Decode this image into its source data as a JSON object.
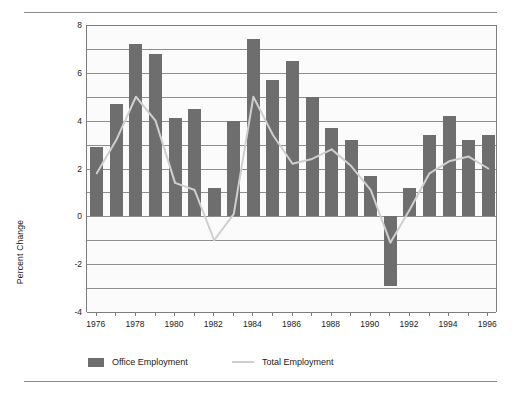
{
  "chart_data": {
    "type": "bar",
    "title": "",
    "xlabel": "",
    "ylabel": "Percent Change",
    "ylim": [
      -4,
      8
    ],
    "ytick_labels": [
      "8",
      "6",
      "4",
      "2",
      "0",
      "-2",
      "-4"
    ],
    "ytick_values": [
      8,
      6,
      4,
      2,
      0,
      -2,
      -4
    ],
    "gridlines_every": 1,
    "grid": true,
    "legend_position": "bottom-left",
    "categories": [
      1976,
      1977,
      1978,
      1979,
      1980,
      1981,
      1982,
      1983,
      1984,
      1985,
      1986,
      1987,
      1988,
      1989,
      1990,
      1991,
      1992,
      1993,
      1994,
      1995,
      1996
    ],
    "xtick_labels": [
      "1976",
      "1978",
      "1980",
      "1982",
      "1984",
      "1986",
      "1988",
      "1990",
      "1992",
      "1994",
      "1996"
    ],
    "series": [
      {
        "name": "Office Employment",
        "kind": "bar",
        "color": "#6e6e6e",
        "values": [
          2.9,
          4.7,
          7.2,
          6.8,
          4.1,
          4.5,
          1.2,
          4.0,
          7.4,
          5.7,
          6.5,
          5.0,
          3.7,
          3.2,
          1.7,
          -2.9,
          1.2,
          3.4,
          4.2,
          3.2,
          3.4
        ]
      },
      {
        "name": "Total Employment",
        "kind": "line",
        "color": "#cfcfcf",
        "values": [
          1.8,
          3.2,
          5.0,
          4.0,
          1.4,
          1.1,
          -1.0,
          0.1,
          5.0,
          3.4,
          2.2,
          2.4,
          2.8,
          2.1,
          1.1,
          -1.1,
          0.3,
          1.8,
          2.3,
          2.5,
          2.0
        ]
      }
    ]
  },
  "legend": {
    "items": [
      {
        "label": "Office Employment",
        "marker": "bar-swatch",
        "color": "#6e6e6e"
      },
      {
        "label": "Total Employment",
        "marker": "line-swatch",
        "color": "#cfcfcf"
      }
    ]
  },
  "axes": {
    "y_title": "Percent Change"
  },
  "colors": {
    "bar": "#6e6e6e",
    "line": "#cfcfcf",
    "grid": "#8e8e8e",
    "axis": "#7d7d7d",
    "rule": "#8a8a8a",
    "text": "#1b1b1b",
    "plot_bg": "#fbfbfb",
    "page_bg": "#ffffff"
  }
}
